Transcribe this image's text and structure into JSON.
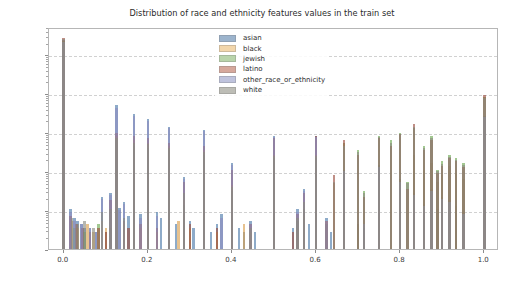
{
  "figure": {
    "background_color": "#ffffff",
    "width": 524,
    "height": 284
  },
  "chart_data": {
    "type": "bar",
    "title": "Distribution of race and ethnicity features values in the train set",
    "xlabel": "",
    "ylabel": "",
    "yscale": "log",
    "ylim": [
      1,
      500000
    ],
    "xlim": [
      -0.035,
      1.035
    ],
    "grid": true,
    "grid_axis": "y",
    "legend_position": "upper center",
    "xticks": [
      0.0,
      0.2,
      0.4,
      0.6,
      0.8,
      1.0
    ],
    "xticklabels": [
      "0.0",
      "0.2",
      "0.4",
      "0.6",
      "0.8",
      "1.0"
    ],
    "yticks": [
      1,
      10,
      100,
      1000,
      10000,
      100000
    ],
    "yticklabels": [
      "10⁰",
      "10¹",
      "10²",
      "10³",
      "10⁴",
      "10⁵"
    ],
    "yticklabels_mantissa": [
      "10",
      "10",
      "10",
      "10",
      "10",
      "10"
    ],
    "yticklabels_exponent": [
      "0",
      "1",
      "2",
      "3",
      "4",
      "5"
    ],
    "bar_width": 0.006,
    "alpha": 0.62,
    "series": [
      {
        "name": "asian",
        "color": "#4878a8",
        "legend_color": "#9cb4cd",
        "points": [
          {
            "x": 0.0,
            "y": 260000
          },
          {
            "x": 0.016,
            "y": 12
          },
          {
            "x": 0.026,
            "y": 7
          },
          {
            "x": 0.033,
            "y": 6
          },
          {
            "x": 0.042,
            "y": 5
          },
          {
            "x": 0.05,
            "y": 4
          },
          {
            "x": 0.062,
            "y": 4
          },
          {
            "x": 0.077,
            "y": 3
          },
          {
            "x": 0.091,
            "y": 25
          },
          {
            "x": 0.1,
            "y": 3
          },
          {
            "x": 0.111,
            "y": 30
          },
          {
            "x": 0.125,
            "y": 5600
          },
          {
            "x": 0.133,
            "y": 13
          },
          {
            "x": 0.143,
            "y": 18
          },
          {
            "x": 0.154,
            "y": 8
          },
          {
            "x": 0.167,
            "y": 3200
          },
          {
            "x": 0.182,
            "y": 9
          },
          {
            "x": 0.2,
            "y": 2400
          },
          {
            "x": 0.222,
            "y": 10
          },
          {
            "x": 0.231,
            "y": 7
          },
          {
            "x": 0.25,
            "y": 1500
          },
          {
            "x": 0.267,
            "y": 5
          },
          {
            "x": 0.286,
            "y": 80
          },
          {
            "x": 0.3,
            "y": 6
          },
          {
            "x": 0.308,
            "y": 4
          },
          {
            "x": 0.333,
            "y": 1300
          },
          {
            "x": 0.35,
            "y": 3
          },
          {
            "x": 0.364,
            "y": 5
          },
          {
            "x": 0.375,
            "y": 9
          },
          {
            "x": 0.4,
            "y": 180
          },
          {
            "x": 0.417,
            "y": 4
          },
          {
            "x": 0.429,
            "y": 3
          },
          {
            "x": 0.444,
            "y": 6
          },
          {
            "x": 0.455,
            "y": 3
          },
          {
            "x": 0.5,
            "y": 900
          },
          {
            "x": 0.545,
            "y": 4
          },
          {
            "x": 0.556,
            "y": 12
          },
          {
            "x": 0.571,
            "y": 40
          },
          {
            "x": 0.583,
            "y": 5
          },
          {
            "x": 0.6,
            "y": 900
          },
          {
            "x": 0.625,
            "y": 7
          },
          {
            "x": 0.636,
            "y": 3
          },
          {
            "x": 0.667,
            "y": 120
          },
          {
            "x": 0.7,
            "y": 5
          },
          {
            "x": 0.714,
            "y": 4
          },
          {
            "x": 0.75,
            "y": 160
          },
          {
            "x": 0.8,
            "y": 70
          },
          {
            "x": 0.833,
            "y": 30
          },
          {
            "x": 0.857,
            "y": 16
          },
          {
            "x": 0.875,
            "y": 40
          },
          {
            "x": 0.889,
            "y": 12
          },
          {
            "x": 0.9,
            "y": 25
          },
          {
            "x": 0.917,
            "y": 20
          },
          {
            "x": 0.933,
            "y": 14
          },
          {
            "x": 0.95,
            "y": 10
          },
          {
            "x": 1.0,
            "y": 3000
          }
        ]
      },
      {
        "name": "black",
        "color": "#d89c4a",
        "legend_color": "#f2d6ab",
        "points": [
          {
            "x": 0.0,
            "y": 250000
          },
          {
            "x": 0.02,
            "y": 6
          },
          {
            "x": 0.033,
            "y": 4
          },
          {
            "x": 0.056,
            "y": 5
          },
          {
            "x": 0.071,
            "y": 3
          },
          {
            "x": 0.091,
            "y": 6
          },
          {
            "x": 0.1,
            "y": 4
          },
          {
            "x": 0.125,
            "y": 900
          },
          {
            "x": 0.143,
            "y": 5
          },
          {
            "x": 0.167,
            "y": 700
          },
          {
            "x": 0.182,
            "y": 4
          },
          {
            "x": 0.2,
            "y": 600
          },
          {
            "x": 0.222,
            "y": 3
          },
          {
            "x": 0.25,
            "y": 500
          },
          {
            "x": 0.273,
            "y": 6
          },
          {
            "x": 0.286,
            "y": 20
          },
          {
            "x": 0.3,
            "y": 4
          },
          {
            "x": 0.333,
            "y": 400
          },
          {
            "x": 0.364,
            "y": 3
          },
          {
            "x": 0.4,
            "y": 50
          },
          {
            "x": 0.429,
            "y": 5
          },
          {
            "x": 0.444,
            "y": 3
          },
          {
            "x": 0.5,
            "y": 300
          },
          {
            "x": 0.556,
            "y": 4
          },
          {
            "x": 0.571,
            "y": 8
          },
          {
            "x": 0.6,
            "y": 300
          },
          {
            "x": 0.625,
            "y": 6
          },
          {
            "x": 0.643,
            "y": 55
          },
          {
            "x": 0.667,
            "y": 40
          },
          {
            "x": 0.7,
            "y": 5
          },
          {
            "x": 0.75,
            "y": 60
          },
          {
            "x": 0.8,
            "y": 30
          },
          {
            "x": 0.833,
            "y": 300
          },
          {
            "x": 0.857,
            "y": 120
          },
          {
            "x": 0.875,
            "y": 180
          },
          {
            "x": 0.889,
            "y": 60
          },
          {
            "x": 0.9,
            "y": 90
          },
          {
            "x": 0.917,
            "y": 150
          },
          {
            "x": 0.933,
            "y": 100
          },
          {
            "x": 0.95,
            "y": 70
          },
          {
            "x": 1.0,
            "y": 2500
          }
        ]
      },
      {
        "name": "jewish",
        "color": "#6aa84f",
        "legend_color": "#b9d4ab",
        "points": [
          {
            "x": 0.0,
            "y": 240000
          },
          {
            "x": 0.026,
            "y": 4
          },
          {
            "x": 0.05,
            "y": 3
          },
          {
            "x": 0.083,
            "y": 5
          },
          {
            "x": 0.111,
            "y": 4
          },
          {
            "x": 0.125,
            "y": 700
          },
          {
            "x": 0.167,
            "y": 500
          },
          {
            "x": 0.2,
            "y": 450
          },
          {
            "x": 0.25,
            "y": 400
          },
          {
            "x": 0.286,
            "y": 15
          },
          {
            "x": 0.333,
            "y": 300
          },
          {
            "x": 0.4,
            "y": 35
          },
          {
            "x": 0.5,
            "y": 250
          },
          {
            "x": 0.556,
            "y": 6
          },
          {
            "x": 0.571,
            "y": 12
          },
          {
            "x": 0.6,
            "y": 250
          },
          {
            "x": 0.625,
            "y": 5
          },
          {
            "x": 0.667,
            "y": 600
          },
          {
            "x": 0.7,
            "y": 400
          },
          {
            "x": 0.714,
            "y": 35
          },
          {
            "x": 0.75,
            "y": 900
          },
          {
            "x": 0.778,
            "y": 700
          },
          {
            "x": 0.8,
            "y": 1100
          },
          {
            "x": 0.818,
            "y": 60
          },
          {
            "x": 0.833,
            "y": 1400
          },
          {
            "x": 0.857,
            "y": 500
          },
          {
            "x": 0.875,
            "y": 900
          },
          {
            "x": 0.889,
            "y": 120
          },
          {
            "x": 0.9,
            "y": 200
          },
          {
            "x": 0.917,
            "y": 300
          },
          {
            "x": 0.933,
            "y": 250
          },
          {
            "x": 0.95,
            "y": 180
          },
          {
            "x": 1.0,
            "y": 9000
          }
        ]
      },
      {
        "name": "latino",
        "color": "#9a4a3c",
        "legend_color": "#d6a89c",
        "points": [
          {
            "x": 0.0,
            "y": 300000
          },
          {
            "x": 0.016,
            "y": 8
          },
          {
            "x": 0.03,
            "y": 5
          },
          {
            "x": 0.045,
            "y": 4
          },
          {
            "x": 0.062,
            "y": 3
          },
          {
            "x": 0.083,
            "y": 4
          },
          {
            "x": 0.1,
            "y": 3
          },
          {
            "x": 0.111,
            "y": 20
          },
          {
            "x": 0.125,
            "y": 1100
          },
          {
            "x": 0.143,
            "y": 6
          },
          {
            "x": 0.154,
            "y": 4
          },
          {
            "x": 0.167,
            "y": 900
          },
          {
            "x": 0.182,
            "y": 5
          },
          {
            "x": 0.2,
            "y": 800
          },
          {
            "x": 0.222,
            "y": 4
          },
          {
            "x": 0.25,
            "y": 600
          },
          {
            "x": 0.286,
            "y": 60
          },
          {
            "x": 0.3,
            "y": 5
          },
          {
            "x": 0.333,
            "y": 500
          },
          {
            "x": 0.364,
            "y": 4
          },
          {
            "x": 0.4,
            "y": 120
          },
          {
            "x": 0.444,
            "y": 5
          },
          {
            "x": 0.5,
            "y": 800
          },
          {
            "x": 0.545,
            "y": 3
          },
          {
            "x": 0.556,
            "y": 9
          },
          {
            "x": 0.571,
            "y": 30
          },
          {
            "x": 0.6,
            "y": 900
          },
          {
            "x": 0.625,
            "y": 6
          },
          {
            "x": 0.643,
            "y": 90
          },
          {
            "x": 0.667,
            "y": 700
          },
          {
            "x": 0.7,
            "y": 300
          },
          {
            "x": 0.714,
            "y": 25
          },
          {
            "x": 0.75,
            "y": 800
          },
          {
            "x": 0.778,
            "y": 500
          },
          {
            "x": 0.8,
            "y": 1000
          },
          {
            "x": 0.818,
            "y": 40
          },
          {
            "x": 0.833,
            "y": 1800
          },
          {
            "x": 0.857,
            "y": 400
          },
          {
            "x": 0.875,
            "y": 700
          },
          {
            "x": 0.889,
            "y": 100
          },
          {
            "x": 0.9,
            "y": 150
          },
          {
            "x": 0.917,
            "y": 250
          },
          {
            "x": 0.933,
            "y": 200
          },
          {
            "x": 0.95,
            "y": 140
          },
          {
            "x": 1.0,
            "y": 10000
          }
        ]
      },
      {
        "name": "other_race_or_ethnicity",
        "color": "#8c8cc0",
        "legend_color": "#bfc3dd",
        "points": [
          {
            "x": 0.0,
            "y": 230000
          },
          {
            "x": 0.016,
            "y": 10
          },
          {
            "x": 0.026,
            "y": 6
          },
          {
            "x": 0.042,
            "y": 5
          },
          {
            "x": 0.062,
            "y": 4
          },
          {
            "x": 0.077,
            "y": 3
          },
          {
            "x": 0.091,
            "y": 22
          },
          {
            "x": 0.111,
            "y": 28
          },
          {
            "x": 0.125,
            "y": 4800
          },
          {
            "x": 0.133,
            "y": 11
          },
          {
            "x": 0.143,
            "y": 16
          },
          {
            "x": 0.167,
            "y": 2900
          },
          {
            "x": 0.182,
            "y": 7
          },
          {
            "x": 0.2,
            "y": 2200
          },
          {
            "x": 0.222,
            "y": 8
          },
          {
            "x": 0.25,
            "y": 1400
          },
          {
            "x": 0.286,
            "y": 70
          },
          {
            "x": 0.333,
            "y": 1200
          },
          {
            "x": 0.375,
            "y": 7
          },
          {
            "x": 0.4,
            "y": 160
          },
          {
            "x": 0.444,
            "y": 5
          },
          {
            "x": 0.5,
            "y": 850
          },
          {
            "x": 0.556,
            "y": 10
          },
          {
            "x": 0.571,
            "y": 35
          },
          {
            "x": 0.6,
            "y": 850
          },
          {
            "x": 0.625,
            "y": 6
          },
          {
            "x": 0.667,
            "y": 110
          },
          {
            "x": 0.714,
            "y": 5
          },
          {
            "x": 0.75,
            "y": 140
          },
          {
            "x": 0.8,
            "y": 60
          },
          {
            "x": 0.833,
            "y": 28
          },
          {
            "x": 0.857,
            "y": 14
          },
          {
            "x": 0.875,
            "y": 35
          },
          {
            "x": 0.9,
            "y": 22
          },
          {
            "x": 0.917,
            "y": 18
          },
          {
            "x": 0.95,
            "y": 9
          },
          {
            "x": 1.0,
            "y": 2800
          }
        ]
      },
      {
        "name": "white",
        "color": "#8a8a80",
        "legend_color": "#bdbdb6",
        "points": [
          {
            "x": 0.0,
            "y": 270000
          },
          {
            "x": 0.02,
            "y": 7
          },
          {
            "x": 0.033,
            "y": 5
          },
          {
            "x": 0.05,
            "y": 6
          },
          {
            "x": 0.071,
            "y": 4
          },
          {
            "x": 0.091,
            "y": 10
          },
          {
            "x": 0.111,
            "y": 12
          },
          {
            "x": 0.125,
            "y": 800
          },
          {
            "x": 0.143,
            "y": 7
          },
          {
            "x": 0.167,
            "y": 600
          },
          {
            "x": 0.2,
            "y": 550
          },
          {
            "x": 0.25,
            "y": 450
          },
          {
            "x": 0.286,
            "y": 30
          },
          {
            "x": 0.333,
            "y": 350
          },
          {
            "x": 0.4,
            "y": 45
          },
          {
            "x": 0.444,
            "y": 4
          },
          {
            "x": 0.5,
            "y": 280
          },
          {
            "x": 0.556,
            "y": 7
          },
          {
            "x": 0.571,
            "y": 18
          },
          {
            "x": 0.6,
            "y": 280
          },
          {
            "x": 0.643,
            "y": 60
          },
          {
            "x": 0.667,
            "y": 500
          },
          {
            "x": 0.7,
            "y": 350
          },
          {
            "x": 0.714,
            "y": 30
          },
          {
            "x": 0.75,
            "y": 850
          },
          {
            "x": 0.778,
            "y": 600
          },
          {
            "x": 0.8,
            "y": 1000
          },
          {
            "x": 0.818,
            "y": 55
          },
          {
            "x": 0.833,
            "y": 1500
          },
          {
            "x": 0.857,
            "y": 450
          },
          {
            "x": 0.875,
            "y": 800
          },
          {
            "x": 0.889,
            "y": 110
          },
          {
            "x": 0.9,
            "y": 170
          },
          {
            "x": 0.917,
            "y": 260
          },
          {
            "x": 0.933,
            "y": 220
          },
          {
            "x": 0.95,
            "y": 160
          },
          {
            "x": 1.0,
            "y": 8500
          }
        ]
      }
    ]
  },
  "legend": {
    "entries": [
      {
        "label": "asian",
        "color": "#9cb4cd"
      },
      {
        "label": "black",
        "color": "#f2d6ab"
      },
      {
        "label": "jewish",
        "color": "#b9d4ab"
      },
      {
        "label": "latino",
        "color": "#d6a89c"
      },
      {
        "label": "other_race_or_ethnicity",
        "color": "#bfc3dd"
      },
      {
        "label": "white",
        "color": "#bdbdb6"
      }
    ]
  }
}
